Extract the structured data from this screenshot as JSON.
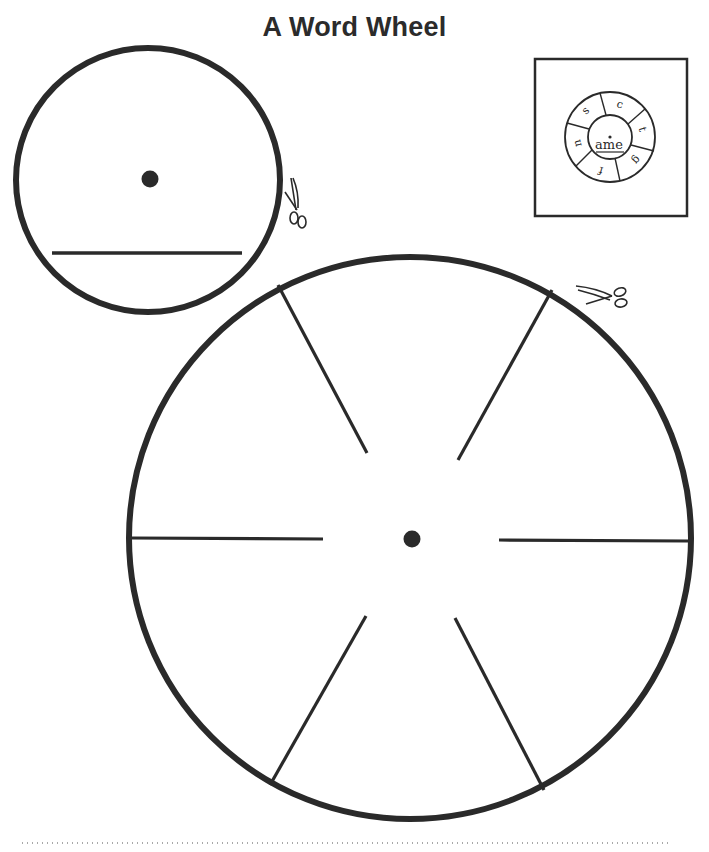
{
  "title": "A Word Wheel",
  "colors": {
    "ink": "#2a2a2a",
    "paper": "#ffffff"
  },
  "inner_wheel": {
    "description": "small circle with center hole and writing line",
    "center_dot": true,
    "writing_line": true
  },
  "outer_wheel": {
    "segments": 6,
    "center_dot": true
  },
  "example_wheel": {
    "stem": "ame",
    "letters": [
      "c",
      "t",
      "g",
      "f",
      "n",
      "s"
    ]
  },
  "icons": {
    "cut_small_circle": "scissors-icon",
    "cut_large_circle": "scissors-icon"
  },
  "footer": {
    "cut_line": "dotted"
  }
}
